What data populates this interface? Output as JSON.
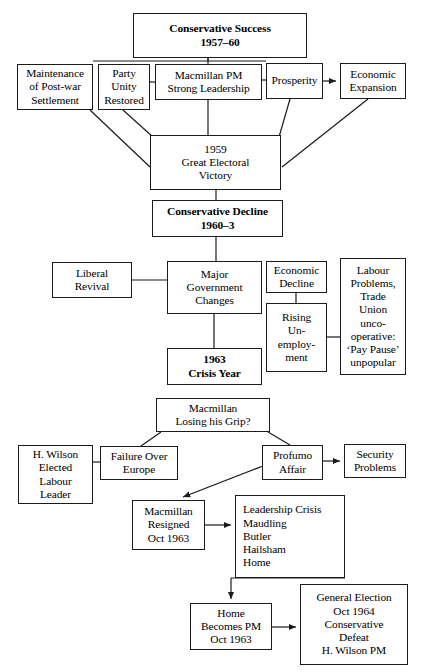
{
  "diagram": {
    "ink_color": "#1a1a1a",
    "background_color": "#ffffff",
    "nodes": [
      {
        "id": "conservative-success",
        "name": "conservative-success-box",
        "bold": true,
        "align": "center",
        "x": 133,
        "y": 13,
        "w": 174,
        "h": 45,
        "lines": [
          "Conservative Success",
          "1957–60"
        ]
      },
      {
        "id": "maintenance",
        "name": "maintenance-post-war-settlement-box",
        "bold": false,
        "align": "center",
        "x": 17,
        "y": 64,
        "w": 76,
        "h": 46,
        "lines": [
          "Maintenance",
          "of Post-war",
          "Settlement"
        ]
      },
      {
        "id": "party-unity",
        "name": "party-unity-restored-box",
        "bold": false,
        "align": "center",
        "x": 98,
        "y": 64,
        "w": 52,
        "h": 46,
        "lines": [
          "Party",
          "Unity",
          "Restored"
        ]
      },
      {
        "id": "macmillan-pm",
        "name": "macmillan-pm-strong-leadership-box",
        "bold": false,
        "align": "center",
        "x": 155,
        "y": 64,
        "w": 107,
        "h": 36,
        "lines": [
          "Macmillan PM",
          "Strong Leadership"
        ]
      },
      {
        "id": "prosperity",
        "name": "prosperity-box",
        "bold": false,
        "align": "center",
        "x": 266,
        "y": 63,
        "w": 57,
        "h": 36,
        "lines": [
          "Prosperity"
        ]
      },
      {
        "id": "economic-expansion",
        "name": "economic-expansion-box",
        "bold": false,
        "align": "center",
        "x": 340,
        "y": 63,
        "w": 66,
        "h": 36,
        "lines": [
          "Economic",
          "Expansion"
        ]
      },
      {
        "id": "great-electoral-victory",
        "name": "great-electoral-victory-box",
        "bold": false,
        "align": "center",
        "x": 150,
        "y": 135,
        "w": 131,
        "h": 55,
        "lines": [
          "1959",
          "Great Electoral",
          "Victory"
        ]
      },
      {
        "id": "conservative-decline",
        "name": "conservative-decline-box",
        "bold": true,
        "align": "center",
        "x": 152,
        "y": 200,
        "w": 131,
        "h": 37,
        "lines": [
          "Conservative Decline",
          "1960–3"
        ]
      },
      {
        "id": "liberal-revival",
        "name": "liberal-revival-box",
        "bold": false,
        "align": "center",
        "x": 52,
        "y": 262,
        "w": 80,
        "h": 36,
        "lines": [
          "Liberal",
          "Revival"
        ]
      },
      {
        "id": "major-government-changes",
        "name": "major-government-changes-box",
        "bold": false,
        "align": "center",
        "x": 167,
        "y": 261,
        "w": 95,
        "h": 53,
        "lines": [
          "Major",
          "Government",
          "Changes"
        ]
      },
      {
        "id": "economic-decline",
        "name": "economic-decline-box",
        "bold": false,
        "align": "center",
        "x": 266,
        "y": 261,
        "w": 61,
        "h": 32,
        "lines": [
          "Economic",
          "Decline"
        ]
      },
      {
        "id": "rising-unemployment",
        "name": "rising-unemployment-box",
        "bold": false,
        "align": "center",
        "x": 266,
        "y": 303,
        "w": 61,
        "h": 69,
        "lines": [
          "Rising",
          "Un-",
          "employ-",
          "ment"
        ]
      },
      {
        "id": "labour-problems",
        "name": "labour-problems-trade-union-box",
        "bold": false,
        "align": "center",
        "x": 340,
        "y": 258,
        "w": 66,
        "h": 117,
        "lines": [
          "Labour",
          "Problems,",
          "Trade",
          "Union",
          "unco-",
          "operative:",
          "‘Pay Pause’",
          "unpopular"
        ]
      },
      {
        "id": "crisis-year",
        "name": "crisis-year-1963-box",
        "bold": true,
        "align": "center",
        "x": 167,
        "y": 348,
        "w": 95,
        "h": 37,
        "lines": [
          "1963",
          "Crisis Year"
        ]
      },
      {
        "id": "losing-grip",
        "name": "macmillan-losing-his-grip-box",
        "bold": false,
        "align": "center",
        "x": 156,
        "y": 398,
        "w": 114,
        "h": 34,
        "lines": [
          "Macmillan",
          "Losing his Grip?"
        ]
      },
      {
        "id": "wilson-elected",
        "name": "h-wilson-elected-labour-leader-box",
        "bold": false,
        "align": "center",
        "x": 18,
        "y": 445,
        "w": 75,
        "h": 59,
        "lines": [
          "H. Wilson",
          "Elected",
          "Labour",
          "Leader"
        ]
      },
      {
        "id": "failure-europe",
        "name": "failure-over-europe-box",
        "bold": false,
        "align": "center",
        "x": 100,
        "y": 446,
        "w": 78,
        "h": 34,
        "lines": [
          "Failure Over",
          "Europe"
        ]
      },
      {
        "id": "profumo-affair",
        "name": "profumo-affair-box",
        "bold": false,
        "align": "center",
        "x": 262,
        "y": 445,
        "w": 61,
        "h": 35,
        "lines": [
          "Profumo",
          "Affair"
        ]
      },
      {
        "id": "security-problems",
        "name": "security-problems-box",
        "bold": false,
        "align": "center",
        "x": 344,
        "y": 444,
        "w": 62,
        "h": 34,
        "lines": [
          "Security",
          "Problems"
        ]
      },
      {
        "id": "macmillan-resigned",
        "name": "macmillan-resigned-box",
        "bold": false,
        "align": "center",
        "x": 132,
        "y": 500,
        "w": 73,
        "h": 50,
        "lines": [
          "Macmillan",
          "Resigned",
          "Oct 1963"
        ]
      },
      {
        "id": "leadership-crisis",
        "name": "leadership-crisis-box",
        "bold": false,
        "align": "left",
        "x": 235,
        "y": 495,
        "w": 110,
        "h": 83,
        "lines": [
          "Leadership Crisis",
          "Maudling",
          "Butler",
          "Hailsham",
          "Home"
        ]
      },
      {
        "id": "home-becomes-pm",
        "name": "home-becomes-pm-box",
        "bold": false,
        "align": "center",
        "x": 190,
        "y": 603,
        "w": 82,
        "h": 47,
        "lines": [
          "Home",
          "Becomes PM",
          "Oct 1963"
        ]
      },
      {
        "id": "general-election",
        "name": "general-election-1964-box",
        "bold": false,
        "align": "center",
        "x": 300,
        "y": 584,
        "w": 108,
        "h": 81,
        "lines": [
          "General Election",
          "Oct 1964",
          "Conservative",
          "Defeat",
          "H. Wilson PM"
        ]
      }
    ],
    "edges": [
      {
        "name": "edge-success-to-macmillan",
        "d": "M 208 58 L 208 64",
        "arrow": false
      },
      {
        "name": "edge-success-hbar",
        "d": "M 208 58 L 208 61 M 93 61 L 266 61",
        "arrow": false
      },
      {
        "name": "edge-macmillan-to-prosperity-bar",
        "d": "M 262 80 L 266 80",
        "arrow": false
      },
      {
        "name": "edge-party-to-macmillan-bar",
        "d": "M 150 82 L 155 82",
        "arrow": false
      },
      {
        "name": "edge-prosperity-to-expansion",
        "d": "M 323 81 L 336 81",
        "arrow": true
      },
      {
        "name": "edge-maintenance-to-victory",
        "d": "M 90 110 L 150 167",
        "arrow": false
      },
      {
        "name": "edge-party-unity-to-victory",
        "d": "M 123 110 L 153 137",
        "arrow": false
      },
      {
        "name": "edge-macmillan-to-victory",
        "d": "M 208 100 L 208 135",
        "arrow": false
      },
      {
        "name": "edge-prosperity-to-victory",
        "d": "M 290 99 L 279 137",
        "arrow": false
      },
      {
        "name": "edge-expansion-to-victory",
        "d": "M 368 99 L 282 167",
        "arrow": false
      },
      {
        "name": "edge-victory-to-decline",
        "d": "M 216 190 L 216 200",
        "arrow": false
      },
      {
        "name": "edge-decline-to-changes",
        "d": "M 216 237 L 216 261",
        "arrow": false
      },
      {
        "name": "edge-liberal-to-changes",
        "d": "M 132 280 L 167 280",
        "arrow": false
      },
      {
        "name": "edge-economic-decline-to-unemployment",
        "d": "M 296 293 L 296 303",
        "arrow": false
      },
      {
        "name": "edge-unemployment-to-labour",
        "d": "M 327 337 L 340 337",
        "arrow": false
      },
      {
        "name": "edge-changes-to-crisis",
        "d": "M 214 314 L 214 348",
        "arrow": false
      },
      {
        "name": "edge-grip-to-failure",
        "d": "M 161 432 L 141 446",
        "arrow": false
      },
      {
        "name": "edge-grip-to-profumo",
        "d": "M 268 432 L 290 445",
        "arrow": false
      },
      {
        "name": "edge-wilson-to-failure",
        "d": "M 93 462 L 100 462",
        "arrow": false
      },
      {
        "name": "edge-profumo-to-security",
        "d": "M 323 461 L 340 461",
        "arrow": true
      },
      {
        "name": "edge-profumo-to-resigned",
        "d": "M 263 466 L 183 497",
        "arrow": true
      },
      {
        "name": "edge-resigned-to-leadership",
        "d": "M 205 525 L 231 525",
        "arrow": true
      },
      {
        "name": "edge-leadership-to-home",
        "d": "M 231 578 L 231 599",
        "arrow": true
      },
      {
        "name": "edge-leadership-hbar",
        "d": "M 231 578 L 345 578",
        "arrow": false
      },
      {
        "name": "edge-home-to-general-election",
        "d": "M 272 627 L 296 627",
        "arrow": true
      }
    ]
  }
}
